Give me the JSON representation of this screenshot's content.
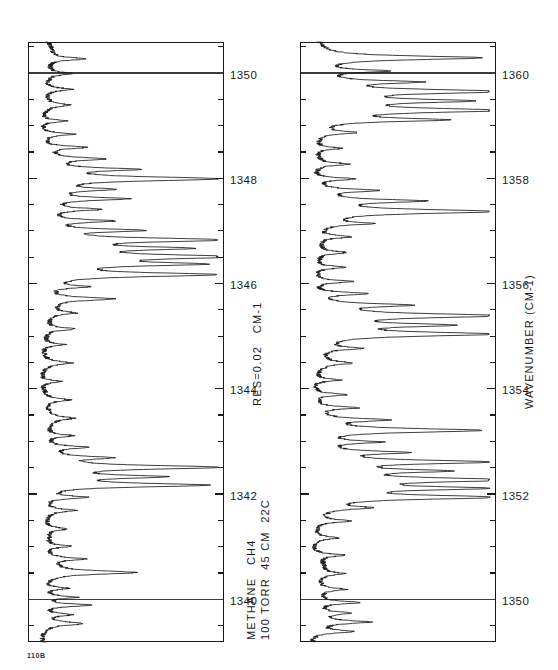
{
  "figure": {
    "corner_id": "110B",
    "header_line1": "METHANE   CH4",
    "header_line2": "100 TORR  45 CM  22C",
    "resolution_label": "RES=0.02   CM-1",
    "axis_title": "WAVENUMBER  (CM-1)"
  },
  "chart_data": {
    "type": "line",
    "subtitle": "100 TORR, 45 CM path, 22C, RES=0.02 CM-1",
    "xlabel": "WAVENUMBER (CM-1)",
    "ylabel": "TRANSMITTANCE",
    "orientation": "page rotated 90 degrees counter-clockwise",
    "grid": false,
    "legend": null,
    "ylim": [
      0,
      1
    ],
    "panels": [
      {
        "name": "upper-panel",
        "xlim": [
          1339.2,
          1350.6
        ],
        "xtick_major_step": 2,
        "xtick_minor_step": 0.5,
        "xticklabels": [
          "1340",
          "1342",
          "1344",
          "1346",
          "1348",
          "1350"
        ],
        "xticklabel_values": [
          1340,
          1342,
          1344,
          1346,
          1348,
          1350
        ],
        "full_height_gridlines": [
          1340,
          1350
        ],
        "baseline": 0.94,
        "peaks": [
          {
            "x": 1339.55,
            "depth": 0.2,
            "width": 0.035
          },
          {
            "x": 1339.72,
            "depth": 0.14,
            "width": 0.03
          },
          {
            "x": 1339.9,
            "depth": 0.26,
            "width": 0.032
          },
          {
            "x": 1340.05,
            "depth": 0.17,
            "width": 0.03
          },
          {
            "x": 1340.22,
            "depth": 0.12,
            "width": 0.028
          },
          {
            "x": 1340.52,
            "depth": 0.46,
            "width": 0.04
          },
          {
            "x": 1340.78,
            "depth": 0.18,
            "width": 0.03
          },
          {
            "x": 1341.02,
            "depth": 0.13,
            "width": 0.028
          },
          {
            "x": 1341.35,
            "depth": 0.11,
            "width": 0.03
          },
          {
            "x": 1341.7,
            "depth": 0.15,
            "width": 0.03
          },
          {
            "x": 1341.95,
            "depth": 0.22,
            "width": 0.032
          },
          {
            "x": 1342.18,
            "depth": 0.86,
            "width": 0.042
          },
          {
            "x": 1342.34,
            "depth": 0.56,
            "width": 0.036
          },
          {
            "x": 1342.52,
            "depth": 0.9,
            "width": 0.044
          },
          {
            "x": 1342.7,
            "depth": 0.3,
            "width": 0.032
          },
          {
            "x": 1342.9,
            "depth": 0.2,
            "width": 0.03
          },
          {
            "x": 1343.12,
            "depth": 0.14,
            "width": 0.03
          },
          {
            "x": 1343.45,
            "depth": 0.12,
            "width": 0.032
          },
          {
            "x": 1343.8,
            "depth": 0.13,
            "width": 0.032
          },
          {
            "x": 1344.15,
            "depth": 0.11,
            "width": 0.03
          },
          {
            "x": 1344.5,
            "depth": 0.14,
            "width": 0.032
          },
          {
            "x": 1344.85,
            "depth": 0.12,
            "width": 0.03
          },
          {
            "x": 1345.15,
            "depth": 0.16,
            "width": 0.032
          },
          {
            "x": 1345.45,
            "depth": 0.13,
            "width": 0.03
          },
          {
            "x": 1345.72,
            "depth": 0.34,
            "width": 0.036
          },
          {
            "x": 1345.95,
            "depth": 0.2,
            "width": 0.03
          },
          {
            "x": 1346.18,
            "depth": 0.88,
            "width": 0.044
          },
          {
            "x": 1346.38,
            "depth": 0.74,
            "width": 0.04
          },
          {
            "x": 1346.52,
            "depth": 0.95,
            "width": 0.046
          },
          {
            "x": 1346.68,
            "depth": 0.66,
            "width": 0.038
          },
          {
            "x": 1346.84,
            "depth": 0.93,
            "width": 0.044
          },
          {
            "x": 1347.02,
            "depth": 0.5,
            "width": 0.034
          },
          {
            "x": 1347.2,
            "depth": 0.33,
            "width": 0.032
          },
          {
            "x": 1347.42,
            "depth": 0.26,
            "width": 0.032
          },
          {
            "x": 1347.62,
            "depth": 0.4,
            "width": 0.034
          },
          {
            "x": 1347.8,
            "depth": 0.3,
            "width": 0.032
          },
          {
            "x": 1348.0,
            "depth": 0.92,
            "width": 0.046
          },
          {
            "x": 1348.18,
            "depth": 0.44,
            "width": 0.034
          },
          {
            "x": 1348.38,
            "depth": 0.28,
            "width": 0.032
          },
          {
            "x": 1348.6,
            "depth": 0.22,
            "width": 0.03
          },
          {
            "x": 1348.85,
            "depth": 0.17,
            "width": 0.03
          },
          {
            "x": 1349.1,
            "depth": 0.14,
            "width": 0.03
          },
          {
            "x": 1349.4,
            "depth": 0.12,
            "width": 0.03
          },
          {
            "x": 1349.7,
            "depth": 0.15,
            "width": 0.032
          },
          {
            "x": 1350.0,
            "depth": 0.13,
            "width": 0.03
          },
          {
            "x": 1350.28,
            "depth": 0.19,
            "width": 0.032
          }
        ]
      },
      {
        "name": "lower-panel",
        "xlim": [
          1349.2,
          1360.6
        ],
        "xtick_major_step": 2,
        "xtick_minor_step": 0.5,
        "xticklabels": [
          "1350",
          "1352",
          "1354",
          "1356",
          "1358",
          "1360"
        ],
        "xticklabel_values": [
          1350,
          1352,
          1354,
          1356,
          1358,
          1360
        ],
        "full_height_gridlines": [
          1350,
          1360
        ],
        "baseline": 0.94,
        "peaks": [
          {
            "x": 1349.4,
            "depth": 0.2,
            "width": 0.032
          },
          {
            "x": 1349.58,
            "depth": 0.26,
            "width": 0.034
          },
          {
            "x": 1349.75,
            "depth": 0.17,
            "width": 0.03
          },
          {
            "x": 1349.95,
            "depth": 0.22,
            "width": 0.032
          },
          {
            "x": 1350.2,
            "depth": 0.14,
            "width": 0.03
          },
          {
            "x": 1350.5,
            "depth": 0.12,
            "width": 0.03
          },
          {
            "x": 1350.85,
            "depth": 0.15,
            "width": 0.03
          },
          {
            "x": 1351.18,
            "depth": 0.13,
            "width": 0.03
          },
          {
            "x": 1351.5,
            "depth": 0.18,
            "width": 0.032
          },
          {
            "x": 1351.75,
            "depth": 0.24,
            "width": 0.032
          },
          {
            "x": 1351.95,
            "depth": 0.93,
            "width": 0.046
          },
          {
            "x": 1352.12,
            "depth": 0.8,
            "width": 0.04
          },
          {
            "x": 1352.28,
            "depth": 0.95,
            "width": 0.046
          },
          {
            "x": 1352.45,
            "depth": 0.58,
            "width": 0.036
          },
          {
            "x": 1352.62,
            "depth": 0.86,
            "width": 0.042
          },
          {
            "x": 1352.8,
            "depth": 0.4,
            "width": 0.034
          },
          {
            "x": 1353.0,
            "depth": 0.3,
            "width": 0.032
          },
          {
            "x": 1353.22,
            "depth": 0.88,
            "width": 0.044
          },
          {
            "x": 1353.42,
            "depth": 0.35,
            "width": 0.032
          },
          {
            "x": 1353.65,
            "depth": 0.22,
            "width": 0.03
          },
          {
            "x": 1353.9,
            "depth": 0.17,
            "width": 0.03
          },
          {
            "x": 1354.18,
            "depth": 0.14,
            "width": 0.03
          },
          {
            "x": 1354.5,
            "depth": 0.16,
            "width": 0.032
          },
          {
            "x": 1354.78,
            "depth": 0.2,
            "width": 0.032
          },
          {
            "x": 1355.05,
            "depth": 0.9,
            "width": 0.046
          },
          {
            "x": 1355.22,
            "depth": 0.62,
            "width": 0.038
          },
          {
            "x": 1355.4,
            "depth": 0.94,
            "width": 0.046
          },
          {
            "x": 1355.6,
            "depth": 0.45,
            "width": 0.034
          },
          {
            "x": 1355.82,
            "depth": 0.28,
            "width": 0.032
          },
          {
            "x": 1356.05,
            "depth": 0.2,
            "width": 0.03
          },
          {
            "x": 1356.32,
            "depth": 0.16,
            "width": 0.03
          },
          {
            "x": 1356.6,
            "depth": 0.14,
            "width": 0.03
          },
          {
            "x": 1356.9,
            "depth": 0.18,
            "width": 0.032
          },
          {
            "x": 1357.15,
            "depth": 0.24,
            "width": 0.032
          },
          {
            "x": 1357.38,
            "depth": 0.92,
            "width": 0.046
          },
          {
            "x": 1357.58,
            "depth": 0.52,
            "width": 0.036
          },
          {
            "x": 1357.78,
            "depth": 0.3,
            "width": 0.032
          },
          {
            "x": 1358.0,
            "depth": 0.22,
            "width": 0.03
          },
          {
            "x": 1358.28,
            "depth": 0.17,
            "width": 0.03
          },
          {
            "x": 1358.58,
            "depth": 0.14,
            "width": 0.03
          },
          {
            "x": 1358.88,
            "depth": 0.2,
            "width": 0.032
          },
          {
            "x": 1359.12,
            "depth": 0.64,
            "width": 0.038
          },
          {
            "x": 1359.3,
            "depth": 0.91,
            "width": 0.046
          },
          {
            "x": 1359.48,
            "depth": 0.7,
            "width": 0.04
          },
          {
            "x": 1359.66,
            "depth": 0.94,
            "width": 0.046
          },
          {
            "x": 1359.84,
            "depth": 0.48,
            "width": 0.034
          },
          {
            "x": 1360.05,
            "depth": 0.34,
            "width": 0.032
          },
          {
            "x": 1360.3,
            "depth": 0.88,
            "width": 0.044
          }
        ]
      }
    ]
  }
}
